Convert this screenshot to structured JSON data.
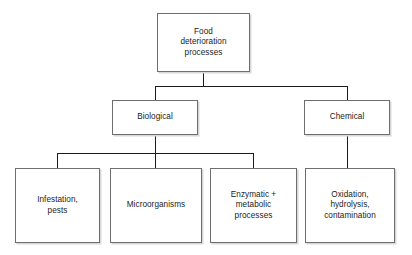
{
  "diagram": {
    "title_node": {
      "id": "root",
      "label": "Food\ndeterioration\nprocesses"
    },
    "level2": [
      {
        "id": "biological",
        "label": "Biological"
      },
      {
        "id": "chemical",
        "label": "Chemical"
      }
    ],
    "level3": [
      {
        "id": "infestation-pests",
        "label": "Infestation,\npests",
        "parent": "biological"
      },
      {
        "id": "microorganisms",
        "label": "Microorganisms",
        "parent": "biological"
      },
      {
        "id": "enzymatic-metabolic",
        "label": "Enzymatic +\nmetabolic\nprocesses",
        "parent": "biological"
      },
      {
        "id": "oxidation-hydrolysis",
        "label": "Oxidation,\nhydrolysis,\ncontamination",
        "parent": "chemical"
      }
    ],
    "colors": {
      "background": "#ffffff",
      "box_border": "#6e6e6e",
      "box_fill": "#ffffff",
      "box_shadow": "#d8d8d8",
      "connector": "#1b1b1b",
      "text": "#1b1b1b"
    }
  }
}
